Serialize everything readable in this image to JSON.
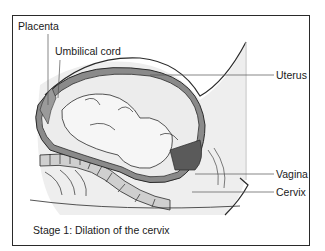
{
  "diagram": {
    "caption": "Stage 1: Dilation of the cervix",
    "labels": {
      "placenta": "Placenta",
      "umbilical_cord": "Umbilical cord",
      "uterus": "Uterus",
      "vagina": "Vagina",
      "cervix": "Cervix"
    },
    "colors": {
      "outline": "#2a2a2a",
      "uterine_wall": "#8a8a8a",
      "amniotic_fill": "#e8e8e8",
      "skin_shade": "#d8d8d8",
      "dark_tissue": "#5a5a5a"
    }
  }
}
